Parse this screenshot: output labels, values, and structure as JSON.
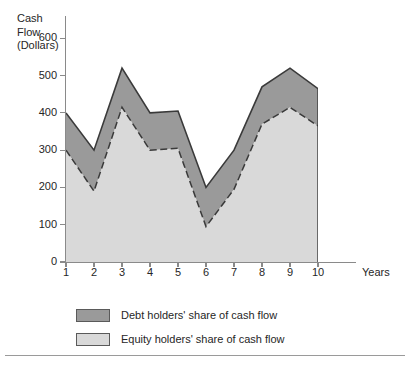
{
  "chart_data": {
    "type": "area",
    "stacked": true,
    "title": "",
    "ylabel": "Cash Flow (Dollars)",
    "ylabel_lines": [
      "Cash",
      "Flow",
      "(Dollars)"
    ],
    "xlabel": "Years",
    "x": [
      1,
      2,
      3,
      4,
      5,
      6,
      7,
      8,
      9,
      10
    ],
    "xticklabels": [
      "1",
      "2",
      "3",
      "4",
      "5",
      "6",
      "7",
      "8",
      "9",
      "10"
    ],
    "yticks": [
      0,
      100,
      200,
      300,
      400,
      500,
      600
    ],
    "yticklabels": [
      "0",
      "100",
      "200",
      "300",
      "400",
      "500",
      "600"
    ],
    "ylim": [
      0,
      660
    ],
    "xlim": [
      1,
      10
    ],
    "grid": false,
    "legend_position": "below-left",
    "series": [
      {
        "name": "Equity holders' share of cash flow",
        "color": "#d9d9d9",
        "values": [
          300,
          190,
          415,
          300,
          305,
          95,
          195,
          370,
          415,
          365
        ]
      },
      {
        "name": "Debt holders' share of cash flow",
        "color": "#9a9a9a",
        "values": [
          100,
          110,
          105,
          100,
          100,
          105,
          105,
          100,
          105,
          100
        ]
      }
    ],
    "totals": [
      400,
      300,
      520,
      400,
      405,
      200,
      300,
      470,
      520,
      465
    ],
    "annotations": []
  },
  "legend": {
    "items": [
      {
        "label": "Debt holders' share of cash flow",
        "color": "#9a9a9a"
      },
      {
        "label": "Equity holders' share of cash flow",
        "color": "#d9d9d9"
      }
    ]
  },
  "colors": {
    "debt": "#9a9a9a",
    "equity": "#d9d9d9",
    "axis": "#8a8a8a",
    "outline": "#3a3a3a",
    "text": "#262626",
    "rule": "#9a9a9a"
  }
}
